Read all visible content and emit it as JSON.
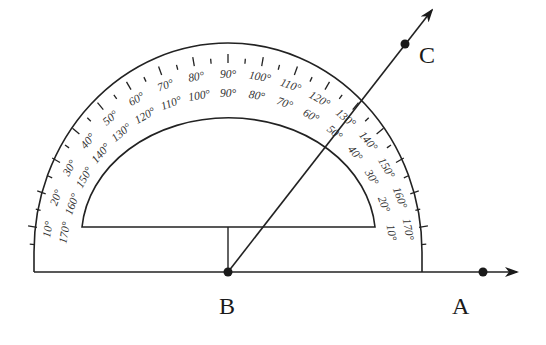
{
  "diagram": {
    "title": "",
    "points": {
      "A": {
        "label": "A",
        "x": 483,
        "y": 272
      },
      "B": {
        "label": "B",
        "x": 228,
        "y": 272
      },
      "C": {
        "label": "C",
        "x": 405,
        "y": 44
      }
    },
    "rays": [
      {
        "name": "ray-BA",
        "from": "B",
        "through": "A",
        "arrow": [
          517,
          272
        ]
      },
      {
        "name": "ray-BC",
        "from": "B",
        "through": "C",
        "arrow": [
          432,
          10
        ]
      }
    ],
    "protractor": {
      "outer_scale": [
        "10°",
        "20°",
        "30°",
        "40°",
        "50°",
        "60°",
        "70°",
        "80°",
        "90°",
        "100°",
        "110°",
        "120°",
        "130°",
        "140°",
        "150°",
        "160°",
        "170°"
      ],
      "inner_scale": [
        "170°",
        "160°",
        "150°",
        "140°",
        "130°",
        "120°",
        "110°",
        "100°",
        "90°",
        "80°",
        "70°",
        "60°",
        "50°",
        "40°",
        "30°",
        "20°",
        "10°"
      ],
      "ink_color": "#222222"
    }
  }
}
